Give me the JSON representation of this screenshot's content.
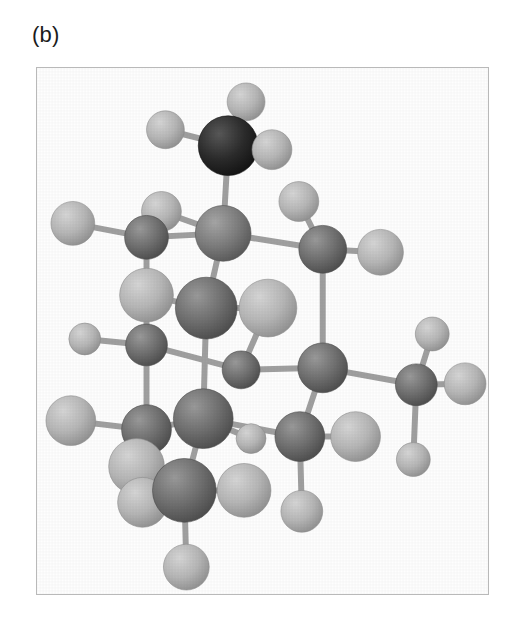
{
  "figure": {
    "panel_label": "(b)",
    "caption_visible": false,
    "background_color": "#ffffff",
    "frame": {
      "x": 36,
      "y": 67,
      "width": 453,
      "height": 528,
      "border_color": "#b9b9b9",
      "border_width": 1
    },
    "render_style": "grayscale shaded spheres with cylindrical bonds"
  },
  "palette": {
    "black_atom": "#2b2b2b",
    "dark_gray_atom": "#6e6e6e",
    "mid_gray_atom": "#7c7c7c",
    "light_gray_atom": "#b4b4b4",
    "pale_gray_atom": "#c3c3c3",
    "bond_color": "#a0a0a0",
    "frame_border": "#b9b9b9",
    "label_text": "#1b1b1b",
    "background": "#ffffff"
  },
  "structure": {
    "atom_types": [
      {
        "id": "black",
        "label": "dopant atom (dark)",
        "fill": "#2b2b2b",
        "highlight": "#585858",
        "shadow": "#111111"
      },
      {
        "id": "dark",
        "label": "framework atom (dark gray)",
        "fill": "#6f6f6f",
        "highlight": "#9a9a9a",
        "shadow": "#4a4a4a"
      },
      {
        "id": "mid",
        "label": "framework atom (mid gray)",
        "fill": "#7d7d7d",
        "highlight": "#a6a6a6",
        "shadow": "#565656"
      },
      {
        "id": "light",
        "label": "terminal atom (light gray)",
        "fill": "#b6b6b6",
        "highlight": "#d6d6d6",
        "shadow": "#8e8e8e"
      },
      {
        "id": "pale",
        "label": "terminal atom (pale gray)",
        "fill": "#c4c4c4",
        "highlight": "#e2e2e2",
        "shadow": "#9c9c9c"
      }
    ],
    "atoms": [
      {
        "n": "a01",
        "type": "light",
        "cx": 210,
        "cy": 34,
        "r": 19
      },
      {
        "n": "a02",
        "type": "black",
        "cx": 192,
        "cy": 78,
        "r": 30
      },
      {
        "n": "a03",
        "type": "light",
        "cx": 129,
        "cy": 62,
        "r": 19
      },
      {
        "n": "a04",
        "type": "light",
        "cx": 236,
        "cy": 82,
        "r": 20
      },
      {
        "n": "a05",
        "type": "light",
        "cx": 125,
        "cy": 144,
        "r": 20
      },
      {
        "n": "a06",
        "type": "mid",
        "cx": 187,
        "cy": 166,
        "r": 28
      },
      {
        "n": "a07",
        "type": "dark",
        "cx": 110,
        "cy": 170,
        "r": 22
      },
      {
        "n": "a08",
        "type": "light",
        "cx": 36,
        "cy": 156,
        "r": 22
      },
      {
        "n": "a09",
        "type": "light",
        "cx": 263,
        "cy": 134,
        "r": 20
      },
      {
        "n": "a10",
        "type": "dark",
        "cx": 287,
        "cy": 182,
        "r": 24
      },
      {
        "n": "a11",
        "type": "light",
        "cx": 345,
        "cy": 185,
        "r": 23
      },
      {
        "n": "a12",
        "type": "light",
        "cx": 110,
        "cy": 228,
        "r": 27
      },
      {
        "n": "a13",
        "type": "dark",
        "cx": 170,
        "cy": 241,
        "r": 31
      },
      {
        "n": "a14",
        "type": "light",
        "cx": 232,
        "cy": 241,
        "r": 29
      },
      {
        "n": "a15",
        "type": "dark",
        "cx": 110,
        "cy": 278,
        "r": 21
      },
      {
        "n": "a16",
        "type": "light",
        "cx": 48,
        "cy": 272,
        "r": 16
      },
      {
        "n": "a17",
        "type": "dark",
        "cx": 205,
        "cy": 303,
        "r": 19
      },
      {
        "n": "a18",
        "type": "dark",
        "cx": 287,
        "cy": 301,
        "r": 25
      },
      {
        "n": "a19",
        "type": "dark",
        "cx": 381,
        "cy": 318,
        "r": 21
      },
      {
        "n": "a20",
        "type": "light",
        "cx": 397,
        "cy": 267,
        "r": 17
      },
      {
        "n": "a21",
        "type": "light",
        "cx": 430,
        "cy": 317,
        "r": 21
      },
      {
        "n": "a22",
        "type": "light",
        "cx": 378,
        "cy": 393,
        "r": 17
      },
      {
        "n": "a23",
        "type": "light",
        "cx": 34,
        "cy": 354,
        "r": 25
      },
      {
        "n": "a24",
        "type": "dark",
        "cx": 110,
        "cy": 363,
        "r": 25
      },
      {
        "n": "a25",
        "type": "dark",
        "cx": 167,
        "cy": 352,
        "r": 30
      },
      {
        "n": "a26",
        "type": "light",
        "cx": 215,
        "cy": 372,
        "r": 15
      },
      {
        "n": "a27",
        "type": "dark",
        "cx": 264,
        "cy": 370,
        "r": 25
      },
      {
        "n": "a28",
        "type": "light",
        "cx": 320,
        "cy": 370,
        "r": 25
      },
      {
        "n": "a29",
        "type": "light",
        "cx": 266,
        "cy": 445,
        "r": 21
      },
      {
        "n": "a30",
        "type": "light",
        "cx": 100,
        "cy": 400,
        "r": 28
      },
      {
        "n": "a31",
        "type": "light",
        "cx": 106,
        "cy": 436,
        "r": 25
      },
      {
        "n": "a32",
        "type": "dark",
        "cx": 148,
        "cy": 424,
        "r": 32
      },
      {
        "n": "a33",
        "type": "light",
        "cx": 208,
        "cy": 424,
        "r": 27
      },
      {
        "n": "a34",
        "type": "light",
        "cx": 150,
        "cy": 501,
        "r": 23
      }
    ],
    "bonds": [
      {
        "n": "b01",
        "from": "a02",
        "to": "a01"
      },
      {
        "n": "b02",
        "from": "a02",
        "to": "a03"
      },
      {
        "n": "b03",
        "from": "a02",
        "to": "a04"
      },
      {
        "n": "b04",
        "from": "a02",
        "to": "a06"
      },
      {
        "n": "b05",
        "from": "a06",
        "to": "a05"
      },
      {
        "n": "b06",
        "from": "a06",
        "to": "a07"
      },
      {
        "n": "b07",
        "from": "a07",
        "to": "a08"
      },
      {
        "n": "b08",
        "from": "a06",
        "to": "a10"
      },
      {
        "n": "b09",
        "from": "a10",
        "to": "a09"
      },
      {
        "n": "b10",
        "from": "a10",
        "to": "a11"
      },
      {
        "n": "b11",
        "from": "a10",
        "to": "a18"
      },
      {
        "n": "b12",
        "from": "a06",
        "to": "a13"
      },
      {
        "n": "b13",
        "from": "a13",
        "to": "a12"
      },
      {
        "n": "b14",
        "from": "a07",
        "to": "a12"
      },
      {
        "n": "b15",
        "from": "a12",
        "to": "a15"
      },
      {
        "n": "b16",
        "from": "a15",
        "to": "a16"
      },
      {
        "n": "b17",
        "from": "a15",
        "to": "a17"
      },
      {
        "n": "b18",
        "from": "a13",
        "to": "a25"
      },
      {
        "n": "b19",
        "from": "a13",
        "to": "a14"
      },
      {
        "n": "b20",
        "from": "a14",
        "to": "a17"
      },
      {
        "n": "b21",
        "from": "a17",
        "to": "a18"
      },
      {
        "n": "b22",
        "from": "a18",
        "to": "a19"
      },
      {
        "n": "b23",
        "from": "a19",
        "to": "a20"
      },
      {
        "n": "b24",
        "from": "a19",
        "to": "a21"
      },
      {
        "n": "b25",
        "from": "a19",
        "to": "a22"
      },
      {
        "n": "b26",
        "from": "a15",
        "to": "a24"
      },
      {
        "n": "b27",
        "from": "a24",
        "to": "a23"
      },
      {
        "n": "b28",
        "from": "a24",
        "to": "a25"
      },
      {
        "n": "b29",
        "from": "a25",
        "to": "a27"
      },
      {
        "n": "b30",
        "from": "a27",
        "to": "a28"
      },
      {
        "n": "b31",
        "from": "a27",
        "to": "a29"
      },
      {
        "n": "b32",
        "from": "a18",
        "to": "a27"
      },
      {
        "n": "b33",
        "from": "a25",
        "to": "a32"
      },
      {
        "n": "b34",
        "from": "a32",
        "to": "a31"
      },
      {
        "n": "b35",
        "from": "a32",
        "to": "a33"
      },
      {
        "n": "b36",
        "from": "a32",
        "to": "a34"
      },
      {
        "n": "b37",
        "from": "a30",
        "to": "a24"
      },
      {
        "n": "b38",
        "from": "a26",
        "to": "a25"
      }
    ]
  }
}
